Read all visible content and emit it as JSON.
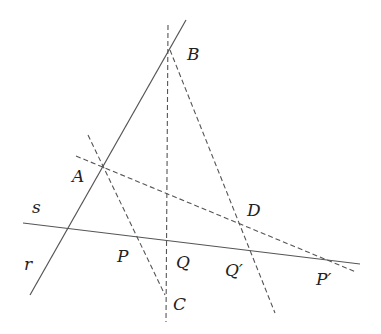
{
  "diagram": {
    "lines": {
      "r": {
        "label": "r",
        "style": "solid",
        "from": [
          30,
          295
        ],
        "to": [
          186,
          20
        ]
      },
      "s": {
        "label": "s",
        "style": "solid",
        "from": [
          23,
          223
        ],
        "to": [
          360,
          264
        ]
      },
      "BC": {
        "style": "dashed",
        "from": [
          168,
          25
        ],
        "to": [
          166,
          322
        ]
      },
      "AC": {
        "style": "dashed",
        "from": [
          88,
          135
        ],
        "to": [
          165,
          295
        ]
      },
      "AP_prime": {
        "style": "dashed",
        "from": [
          76,
          156
        ],
        "to": [
          356,
          272
        ]
      },
      "BQ_prime": {
        "style": "dashed",
        "from": [
          170,
          50
        ],
        "to": [
          275,
          313
        ]
      }
    },
    "points": {
      "A": {
        "label": "A",
        "pos": [
          102,
          167
        ],
        "label_pos": [
          72,
          182
        ]
      },
      "B": {
        "label": "B",
        "pos": [
          170,
          47
        ],
        "label_pos": [
          187,
          60
        ]
      },
      "C": {
        "label": "C",
        "pos": [
          165,
          295
        ],
        "label_pos": [
          173,
          310
        ]
      },
      "D": {
        "label": "D",
        "pos": [
          238,
          222
        ],
        "label_pos": [
          247,
          216
        ]
      },
      "P": {
        "label": "P",
        "pos": [
          136,
          237
        ],
        "label_pos": [
          117,
          262
        ]
      },
      "Q": {
        "label": "Q",
        "pos": [
          168,
          240
        ],
        "label_pos": [
          176,
          268
        ]
      },
      "Q_prime": {
        "label": "Q′",
        "pos": [
          250,
          251
        ],
        "label_pos": [
          225,
          276
        ]
      },
      "P_prime": {
        "label": "P′",
        "pos": [
          335,
          261
        ],
        "label_pos": [
          316,
          285
        ]
      }
    },
    "line_labels": {
      "s": {
        "text": "s",
        "pos": [
          32,
          213
        ]
      },
      "r": {
        "text": "r",
        "pos": [
          24,
          270
        ]
      }
    }
  }
}
